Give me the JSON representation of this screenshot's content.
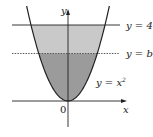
{
  "figure": {
    "type": "region-under-curve-diagram",
    "curve": {
      "equation": "y = x^2",
      "label": "y = x",
      "label_exponent": "2"
    },
    "lines": [
      {
        "name": "upper-bound",
        "label": "y = 4",
        "y_value": 4,
        "style": "solid"
      },
      {
        "name": "split-line",
        "label": "y = b",
        "y_value_symbol": "b",
        "y_value_estimate": 2.5,
        "style": "dashed"
      }
    ],
    "axes": {
      "x_label": "x",
      "y_label": "y",
      "origin_label": "0"
    },
    "regions": [
      {
        "name": "upper-region",
        "from": "b",
        "to": 4,
        "color": "#c9c9c9"
      },
      {
        "name": "lower-region",
        "from": 0,
        "to": "b",
        "color": "#9b9b9b"
      }
    ],
    "colors": {
      "line": "#222222",
      "curve": "#222222"
    }
  }
}
